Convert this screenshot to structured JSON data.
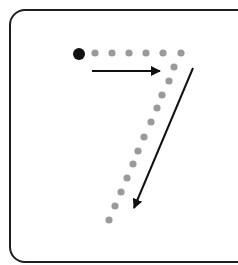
{
  "worksheet": {
    "digit": "7",
    "colors": {
      "border": "#1e1e1e",
      "start_dot": "#111111",
      "trace_dot": "#9a9a9a",
      "arrow": "#111111",
      "background": "#ffffff"
    },
    "start_dot": {
      "cx": 79,
      "cy": 54,
      "r": 6
    },
    "trace_dots": [
      {
        "cx": 95,
        "cy": 53
      },
      {
        "cx": 112,
        "cy": 53
      },
      {
        "cx": 129,
        "cy": 53
      },
      {
        "cx": 146,
        "cy": 53
      },
      {
        "cx": 163,
        "cy": 53
      },
      {
        "cx": 181,
        "cy": 53
      },
      {
        "cx": 174,
        "cy": 67
      },
      {
        "cx": 169,
        "cy": 81
      },
      {
        "cx": 162,
        "cy": 95
      },
      {
        "cx": 157,
        "cy": 108
      },
      {
        "cx": 151,
        "cy": 122
      },
      {
        "cx": 144,
        "cy": 137
      },
      {
        "cx": 138,
        "cy": 151
      },
      {
        "cx": 133,
        "cy": 164
      },
      {
        "cx": 127,
        "cy": 178
      },
      {
        "cx": 121,
        "cy": 192
      },
      {
        "cx": 115,
        "cy": 206
      },
      {
        "cx": 109,
        "cy": 220
      }
    ],
    "arrows": [
      {
        "name": "stroke-1-arrow",
        "direction": "right",
        "x1": 92,
        "y1": 71,
        "x2": 160,
        "y2": 71
      },
      {
        "name": "stroke-2-arrow",
        "direction": "down-left",
        "x1": 193,
        "y1": 68,
        "x2": 134,
        "y2": 208
      }
    ]
  }
}
